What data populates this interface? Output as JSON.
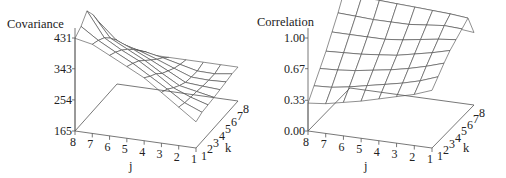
{
  "chart_data": [
    {
      "type": "surface",
      "title": "",
      "zlabel": "Covariance",
      "xlabel": "j",
      "ylabel": "k",
      "x_ticks": [
        "8",
        "7",
        "6",
        "5",
        "4",
        "3",
        "2",
        "1"
      ],
      "y_ticks": [
        "1",
        "2",
        "3",
        "4",
        "5",
        "6",
        "7",
        "8"
      ],
      "z_ticks": [
        "165",
        "254",
        "343",
        "431"
      ],
      "zlim": [
        165,
        470
      ],
      "x": [
        1,
        2,
        3,
        4,
        5,
        6,
        7,
        8
      ],
      "y": [
        1,
        2,
        3,
        4,
        5,
        6,
        7,
        8
      ],
      "z_description": "rows indexed by j (1..8), columns by k (1..8); estimated",
      "z": [
        [
          240,
          248,
          250,
          252,
          255,
          258,
          262,
          262
        ],
        [
          275,
          268,
          265,
          262,
          258,
          256,
          255,
          262
        ],
        [
          310,
          300,
          285,
          272,
          262,
          258,
          256,
          262
        ],
        [
          345,
          330,
          318,
          300,
          288,
          276,
          268,
          262
        ],
        [
          370,
          360,
          348,
          330,
          312,
          295,
          280,
          262
        ],
        [
          395,
          385,
          372,
          355,
          335,
          312,
          290,
          262
        ],
        [
          420,
          412,
          400,
          380,
          355,
          325,
          295,
          262
        ],
        [
          430,
          445,
          470,
          440,
          400,
          350,
          305,
          262
        ]
      ]
    },
    {
      "type": "surface",
      "title": "",
      "zlabel": "Correlation",
      "xlabel": "j",
      "ylabel": "k",
      "x_ticks": [
        "8",
        "7",
        "6",
        "5",
        "4",
        "3",
        "2",
        "1"
      ],
      "y_ticks": [
        "1",
        "2",
        "3",
        "4",
        "5",
        "6",
        "7",
        "8"
      ],
      "z_ticks": [
        "0.00",
        "0.33",
        "0.67",
        "1.00"
      ],
      "zlim": [
        0,
        1.15
      ],
      "x": [
        1,
        2,
        3,
        4,
        5,
        6,
        7,
        8
      ],
      "y": [
        1,
        2,
        3,
        4,
        5,
        6,
        7,
        8
      ],
      "z_description": "rows indexed by j (1..8), columns by k (1..8); estimated",
      "z": [
        [
          0.62,
          0.7,
          0.78,
          0.85,
          0.9,
          0.95,
          1.0,
          0.78
        ],
        [
          0.55,
          0.63,
          0.72,
          0.8,
          0.88,
          0.96,
          1.02,
          0.8
        ],
        [
          0.5,
          0.58,
          0.67,
          0.76,
          0.85,
          0.94,
          1.03,
          0.82
        ],
        [
          0.45,
          0.54,
          0.63,
          0.72,
          0.82,
          0.92,
          1.04,
          0.85
        ],
        [
          0.4,
          0.5,
          0.6,
          0.7,
          0.8,
          0.92,
          1.05,
          0.88
        ],
        [
          0.36,
          0.46,
          0.57,
          0.68,
          0.8,
          0.92,
          1.06,
          0.92
        ],
        [
          0.32,
          0.43,
          0.55,
          0.67,
          0.8,
          0.93,
          1.07,
          0.96
        ],
        [
          0.3,
          0.42,
          0.54,
          0.66,
          0.8,
          0.94,
          1.1,
          1.0
        ]
      ]
    }
  ]
}
